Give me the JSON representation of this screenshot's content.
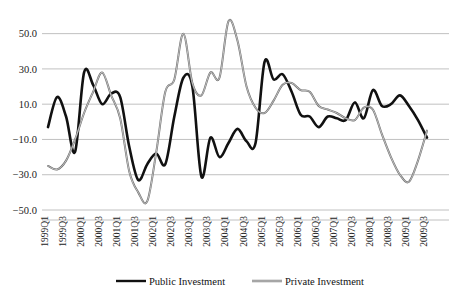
{
  "chart_data": {
    "type": "line",
    "title": "",
    "xlabel": "",
    "ylabel": "",
    "ylim": [
      -50.0,
      60.0
    ],
    "grid": true,
    "gridlines": [
      50.0,
      30.0,
      10.0,
      -10.0,
      -30.0,
      -50.0
    ],
    "ytick_labels": [
      "50.0",
      "30.0",
      "10.0",
      "−10.0",
      "−30.0",
      "−50.0"
    ],
    "ytick_values": [
      50.0,
      30.0,
      10.0,
      -10.0,
      -30.0,
      -50.0
    ],
    "legend_position": "bottom",
    "x": [
      "1999Q1",
      "1999Q2",
      "1999Q3",
      "1999Q4",
      "2000Q1",
      "2000Q2",
      "2000Q3",
      "2000Q4",
      "2001Q1",
      "2001Q2",
      "2001Q3",
      "2001Q4",
      "2002Q1",
      "2002Q2",
      "2002Q3",
      "2002Q4",
      "2003Q1",
      "2003Q2",
      "2003Q3",
      "2003Q4",
      "2004Q1",
      "2004Q2",
      "2004Q3",
      "2004Q4",
      "2005Q1",
      "2005Q2",
      "2005Q3",
      "2005Q4",
      "2006Q1",
      "2006Q2",
      "2006Q3",
      "2006Q4",
      "2007Q1",
      "2007Q2",
      "2007Q3",
      "2007Q4",
      "2008Q1",
      "2008Q2",
      "2008Q3",
      "2008Q4",
      "2009Q1",
      "2009Q2",
      "2009Q3"
    ],
    "xtick_labels": [
      "1999Q1",
      "1999Q3",
      "2000Q1",
      "2000Q3",
      "2001Q1",
      "2001Q3",
      "2002Q1",
      "2002Q3",
      "2003Q1",
      "2003Q3",
      "2004Q1",
      "2004Q3",
      "2005Q1",
      "2005Q3",
      "2006Q1",
      "2006Q3",
      "2007Q1",
      "2007Q3",
      "2008Q1",
      "2008Q3",
      "2009Q1",
      "2009Q3"
    ],
    "xtick_rotation": 90,
    "series": [
      {
        "name": "Public Investment",
        "color": "#111111",
        "width": 2.6,
        "values": [
          -3.0,
          14.0,
          3.0,
          -17.0,
          28.0,
          21.0,
          10.0,
          16.0,
          14.0,
          -14.0,
          -33.0,
          -24.0,
          -18.0,
          -24.0,
          3.0,
          25.0,
          20.0,
          -31.0,
          -9.0,
          -20.0,
          -12.0,
          -4.0,
          -11.0,
          -12.0,
          34.0,
          24.0,
          27.0,
          17.0,
          4.0,
          3.0,
          -3.0,
          3.0,
          2.0,
          1.0,
          11.0,
          2.0,
          18.0,
          9.0,
          10.0,
          15.0,
          9.0,
          1.0,
          -9.0
        ]
      },
      {
        "name": "Private Investment",
        "color": "#8f8f8f",
        "width": 2.0,
        "values": [
          -25.0,
          -27.0,
          -22.0,
          -10.0,
          5.0,
          17.0,
          28.0,
          15.0,
          2.0,
          -28.0,
          -40.0,
          -45.0,
          -17.0,
          17.0,
          24.0,
          50.0,
          22.0,
          15.0,
          28.0,
          25.0,
          57.0,
          46.0,
          20.0,
          8.0,
          5.0,
          12.0,
          21.0,
          22.0,
          18.0,
          17.0,
          9.0,
          7.0,
          5.0,
          2.0,
          1.0,
          8.0,
          7.0,
          -7.0,
          -20.0,
          -30.0,
          -34.0,
          -22.0,
          -5.0
        ]
      }
    ]
  },
  "legend": {
    "items": [
      {
        "label": "Public Investment",
        "color": "#111111"
      },
      {
        "label": "Private Investment",
        "color": "#8f8f8f"
      }
    ]
  }
}
